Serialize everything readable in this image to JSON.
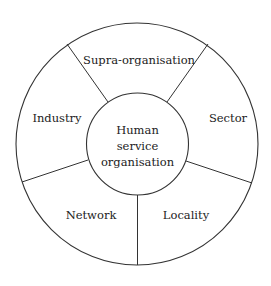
{
  "diagram": {
    "center": {
      "label_lines": [
        "Human",
        "service",
        "organisation"
      ]
    },
    "segments": [
      {
        "id": "supra-organisation",
        "label": "Supra-organisation"
      },
      {
        "id": "sector",
        "label": "Sector"
      },
      {
        "id": "locality",
        "label": "Locality"
      },
      {
        "id": "network",
        "label": "Network"
      },
      {
        "id": "industry",
        "label": "Industry"
      }
    ],
    "colors": {
      "stroke": "#333333",
      "text": "#222222",
      "background": "#ffffff"
    }
  }
}
